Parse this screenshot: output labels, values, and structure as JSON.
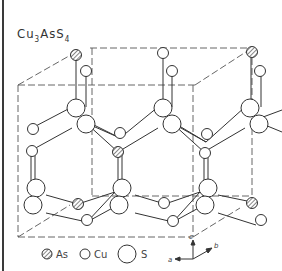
{
  "figure": {
    "formula": {
      "base1": "Cu",
      "sub1": "3",
      "base2": "AsS",
      "sub2": "4"
    },
    "legend": [
      {
        "label": "As",
        "style": "hatched-small"
      },
      {
        "label": "Cu",
        "style": "open-small"
      },
      {
        "label": "S",
        "style": "open-large"
      }
    ],
    "axes": {
      "a": "a",
      "b": "b",
      "c": "c"
    },
    "colors": {
      "line": "#333333",
      "dash": "#555555",
      "hatch": "#666666"
    }
  }
}
